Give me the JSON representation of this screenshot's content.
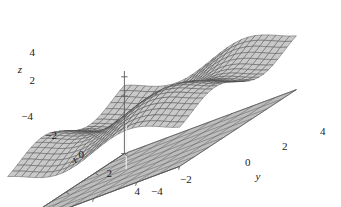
{
  "figure": {
    "name": "surface-plot",
    "background_color": "#ffffff"
  },
  "chart_data": {
    "type": "surface",
    "title": "",
    "xlabel": "x",
    "ylabel": "y",
    "zlabel": "z",
    "xlim": [
      -4,
      4
    ],
    "ylim": [
      -4,
      4
    ],
    "zlim": [
      -4,
      4
    ],
    "xticks": [
      -4,
      -2,
      0,
      2,
      4
    ],
    "yticks": [
      -4,
      -2,
      0,
      2,
      4
    ],
    "zticks": [
      -4,
      2,
      4
    ],
    "xtick_labels": [
      "−4",
      "−2",
      "0",
      "2",
      "4"
    ],
    "ytick_labels": [
      "−4",
      "−2",
      "0",
      "2",
      "4"
    ],
    "ztick_labels": [
      "−4",
      "2",
      "4"
    ],
    "grid": true,
    "legend": "none",
    "mesh_color": "#4a4a4a",
    "surface_fill": "#c9c9c9",
    "floor_fill": "#bdbdbd",
    "floor_grid_color": "#5a5a5a",
    "axis_color": "#5a5a5a",
    "function": "z = sin(x) + sin(y)",
    "surface_samples": 25,
    "floor_level": -4,
    "view": {
      "elevation": 28,
      "azimuth": -60
    }
  },
  "axes": {
    "z": {
      "label": "z",
      "ticks": [
        {
          "value": 4,
          "label": "4"
        },
        {
          "value": 2,
          "label": "2"
        },
        {
          "value": -4,
          "label": "−4"
        }
      ]
    },
    "x": {
      "label": "x",
      "ticks": [
        {
          "value": -2,
          "label": "−2"
        },
        {
          "value": 0,
          "label": "0"
        },
        {
          "value": 2,
          "label": "2"
        },
        {
          "value": 4,
          "label": "4"
        }
      ]
    },
    "y": {
      "label": "y",
      "ticks": [
        {
          "value": -4,
          "label": "−4"
        },
        {
          "value": -2,
          "label": "−2"
        },
        {
          "value": 0,
          "label": "0"
        },
        {
          "value": 2,
          "label": "2"
        },
        {
          "value": 4,
          "label": "4"
        }
      ]
    }
  },
  "labels": {
    "z_4": "4",
    "z_2": "2",
    "z_neg4": "−4",
    "x_neg2": "−2",
    "x_0": "0",
    "x_2": "2",
    "x_4": "4",
    "y_neg4": "−4",
    "y_neg2": "−2",
    "y_0": "0",
    "y_2": "2",
    "y_4": "4",
    "axis_x": "x",
    "axis_y": "y",
    "axis_z": "z"
  }
}
